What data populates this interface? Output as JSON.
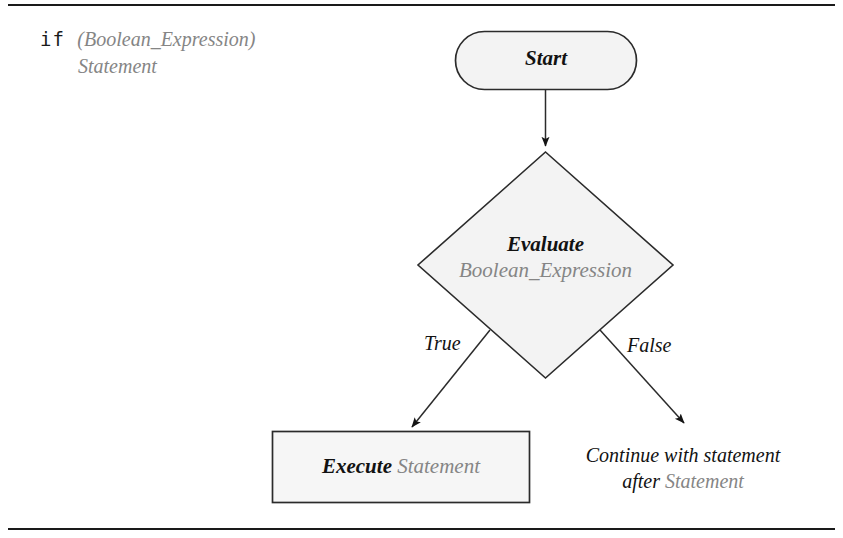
{
  "figure": {
    "kind": "flowchart",
    "caption": {
      "keyword": "if",
      "condition": "(Boolean_Expression)",
      "body": "Statement"
    },
    "colors": {
      "stroke": "#2b2b2b",
      "shape_fill": "#f3f3f3",
      "text_black": "#121212",
      "text_gray": "#858585",
      "rule": "#1a1a1a"
    },
    "nodes": [
      {
        "id": "start",
        "shape": "stadium",
        "label": "Start",
        "label_style": "black-bold-italic"
      },
      {
        "id": "evaluate",
        "shape": "diamond",
        "label_line1": "Evaluate",
        "label_line1_style": "black-bold-italic",
        "label_line2": "Boolean_Expression",
        "label_line2_style": "gray-italic"
      },
      {
        "id": "execute",
        "shape": "rectangle",
        "label_strong": "Execute",
        "label_strong_style": "black-bold-italic",
        "label_plain": "Statement",
        "label_plain_style": "gray-italic"
      },
      {
        "id": "continue",
        "shape": "text",
        "label_line1": "Continue with statement",
        "label_line2_prefix": "after ",
        "label_line2_term": "Statement"
      }
    ],
    "edges": [
      {
        "id": "start-to-evaluate",
        "from": "start",
        "to": "evaluate",
        "label": ""
      },
      {
        "id": "evaluate-true",
        "from": "evaluate",
        "to": "execute",
        "label": "True"
      },
      {
        "id": "evaluate-false",
        "from": "evaluate",
        "to": "continue",
        "label": "False"
      }
    ]
  }
}
